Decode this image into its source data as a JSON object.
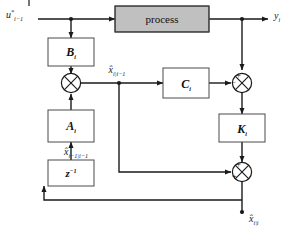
{
  "diagram": {
    "colors": {
      "wire": "#1a1a1a",
      "box_fill": "#ffffff",
      "box_stroke": "#4a4a4a",
      "process_fill": "#c0c0c0",
      "background": "#ffffff"
    },
    "blocks": [
      {
        "id": "process",
        "label": "process",
        "fill": "#c0c0c0",
        "shape": "rect"
      },
      {
        "id": "b-gain",
        "label": "B",
        "sub": "i",
        "shape": "rect"
      },
      {
        "id": "a-gain",
        "label": "A",
        "sub": "i",
        "shape": "rect"
      },
      {
        "id": "c-gain",
        "label": "C",
        "sub": "i",
        "shape": "rect"
      },
      {
        "id": "k-gain",
        "label": "K",
        "sub": "i",
        "shape": "rect"
      },
      {
        "id": "delay",
        "label": "z",
        "sup": "−1",
        "shape": "rect"
      }
    ],
    "junctions": [
      {
        "id": "sum-predict",
        "glyph": "⊗",
        "signs": []
      },
      {
        "id": "sum-innovation",
        "glyph": "⊗",
        "signs": [
          "+",
          "−"
        ]
      },
      {
        "id": "sum-update",
        "glyph": "⊗",
        "signs": [
          "+",
          "+"
        ]
      }
    ],
    "signals": {
      "input": {
        "base": "u",
        "sup": "*",
        "sub": "i−1"
      },
      "output": {
        "base": "y",
        "sub": "i"
      },
      "state_predicted": {
        "base": "x̂",
        "sub": "i|i−1"
      },
      "state_prev": {
        "base": "x̂",
        "sub": "i−1|i−1"
      },
      "state_updated": {
        "base": "x̂",
        "sub": "i|i"
      }
    },
    "signs": {
      "plus": "+",
      "minus": "−"
    }
  }
}
